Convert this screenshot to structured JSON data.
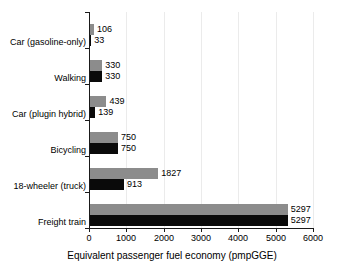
{
  "chart_data": {
    "type": "bar",
    "title": "",
    "subtitle": "",
    "orientation": "horizontal",
    "categories": [
      "Car (gasoline-only)",
      "Walking",
      "Car (plugin hybrid)",
      "Bicycling",
      "18-wheeler (truck)",
      "Freight train"
    ],
    "series": [
      {
        "name": "gray",
        "color": "#8c8c8c",
        "values": [
          106,
          330,
          439,
          750,
          1827,
          5297
        ]
      },
      {
        "name": "black",
        "color": "#0a0a0a",
        "values": [
          33,
          330,
          139,
          750,
          913,
          5297
        ]
      }
    ],
    "xlabel": "Equivalent passenger fuel economy (pmpGGE)",
    "ylabel": "",
    "xlim": [
      0,
      6000
    ],
    "xticks": [
      0,
      1000,
      2000,
      3000,
      4000,
      5000,
      6000
    ],
    "xtick_labels": [
      "0",
      "1000",
      "2000",
      "3000",
      "4000",
      "5000",
      "6000"
    ],
    "grid": "vertical-faint",
    "legend": "none",
    "data_labels": true
  },
  "axis": {
    "x_title": "Equivalent passenger fuel economy (pmpGGE)"
  }
}
